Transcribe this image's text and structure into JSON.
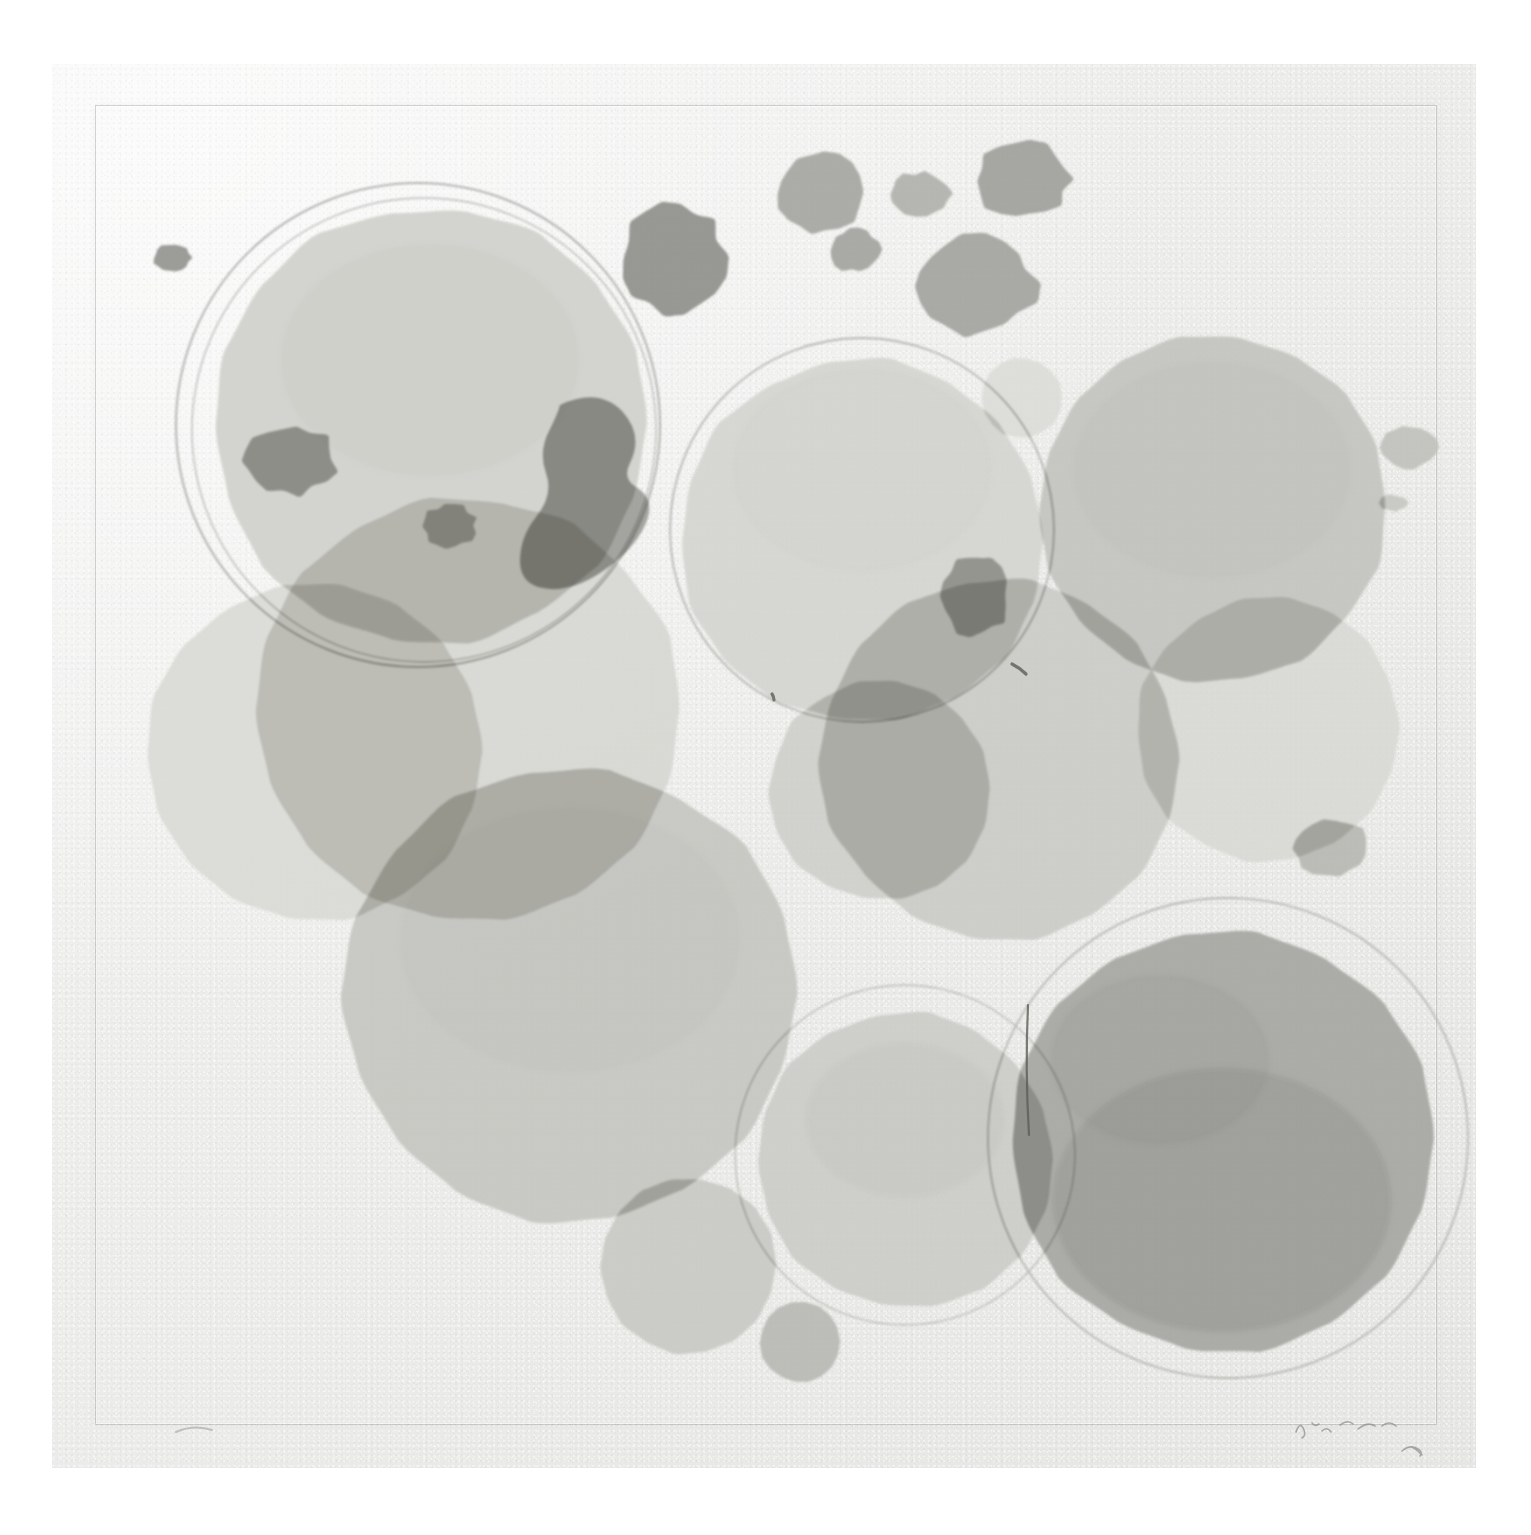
{
  "artwork": {
    "medium_appearance": "watercolor-monotype-print",
    "orientation": "square",
    "background_color": "#ffffff",
    "paper_color": "#ececea",
    "paper_edge": {
      "left": 52,
      "top": 64,
      "width": 1424,
      "height": 1404
    },
    "plate_mark": {
      "left": 95,
      "top": 105,
      "width": 1340,
      "height": 1318,
      "stroke": "#78787655"
    },
    "palette": {
      "paper": "#ececea",
      "wash_lightest": "#e4e3e0",
      "wash_light": "#dcdbd7",
      "wash_mid": "#cfcfcb",
      "wash_medium": "#c3c3bf",
      "wash_dark": "#b3b3af",
      "wash_darker": "#a4a4a0",
      "wash_darkest": "#949490",
      "ink_line": "#8d8d89",
      "pencil": "#8a8a86"
    },
    "signature": {
      "present": true,
      "position": "bottom-right",
      "type": "pencil",
      "legible": false
    },
    "edition_mark": {
      "present": true,
      "position": "bottom-left",
      "type": "pencil",
      "legible": false
    },
    "shapes": [
      {
        "name": "outline-ring-top-left",
        "kind": "ring",
        "cx": 418,
        "cy": 425,
        "r": 242,
        "stroke": "#a9a9a5",
        "stroke_width": 2.0
      },
      {
        "name": "outline-ring-top-left-inner",
        "kind": "ring",
        "cx": 424,
        "cy": 430,
        "r": 232,
        "stroke": "#b2b2ae",
        "stroke_width": 1.4
      },
      {
        "name": "outline-ring-center",
        "kind": "ring",
        "cx": 862,
        "cy": 530,
        "r": 192,
        "stroke": "#adada9",
        "stroke_width": 1.8
      },
      {
        "name": "outline-ring-bottom-right",
        "kind": "ring",
        "cx": 1228,
        "cy": 1138,
        "r": 240,
        "stroke": "#b0b0ac",
        "stroke_width": 1.8
      },
      {
        "name": "outline-ring-bottom-center",
        "kind": "ring",
        "cx": 905,
        "cy": 1155,
        "r": 170,
        "stroke": "#b4b4b0",
        "stroke_width": 1.4
      },
      {
        "name": "wash-circle-top-left-large",
        "kind": "disc",
        "cx": 430,
        "cy": 425,
        "r": 218,
        "fill": "#d1d1cd",
        "opacity": 0.95
      },
      {
        "name": "wash-circle-center-large",
        "kind": "disc",
        "cx": 862,
        "cy": 540,
        "r": 182,
        "fill": "#d4d4d0",
        "opacity": 0.92
      },
      {
        "name": "wash-circle-right-large",
        "kind": "disc",
        "cx": 1212,
        "cy": 508,
        "r": 174,
        "fill": "#c4c4c0",
        "opacity": 0.94
      },
      {
        "name": "wash-circle-left-mid",
        "kind": "disc",
        "cx": 315,
        "cy": 752,
        "r": 168,
        "fill": "#dadad6",
        "opacity": 0.95
      },
      {
        "name": "wash-circle-left-lower",
        "kind": "disc",
        "cx": 468,
        "cy": 710,
        "r": 212,
        "fill": "#d6d6d2",
        "opacity": 0.9
      },
      {
        "name": "wash-circle-bottom-left-big",
        "kind": "disc",
        "cx": 570,
        "cy": 995,
        "r": 228,
        "fill": "#c7c7c3",
        "opacity": 0.96
      },
      {
        "name": "wash-circle-mid-right",
        "kind": "disc",
        "cx": 1000,
        "cy": 760,
        "r": 180,
        "fill": "#cacac6",
        "opacity": 0.9
      },
      {
        "name": "wash-circle-mid-center",
        "kind": "disc",
        "cx": 880,
        "cy": 790,
        "r": 110,
        "fill": "#cdcdc9",
        "opacity": 0.88
      },
      {
        "name": "wash-circle-far-right-lower",
        "kind": "disc",
        "cx": 1268,
        "cy": 730,
        "r": 132,
        "fill": "#d7d7d3",
        "opacity": 0.85
      },
      {
        "name": "wash-circle-bottom-right-big",
        "kind": "disc",
        "cx": 1222,
        "cy": 1140,
        "r": 212,
        "fill": "#a8a8a4",
        "opacity": 0.95
      },
      {
        "name": "wash-circle-bottom-center",
        "kind": "disc",
        "cx": 905,
        "cy": 1160,
        "r": 148,
        "fill": "#cbcbc7",
        "opacity": 0.9
      },
      {
        "name": "wash-circle-bottom-small",
        "kind": "disc",
        "cx": 688,
        "cy": 1266,
        "r": 88,
        "fill": "#c9c9c5",
        "opacity": 0.94
      },
      {
        "name": "wash-circle-bottom-tiny",
        "kind": "disc",
        "cx": 800,
        "cy": 1342,
        "r": 40,
        "fill": "#b8b8b4",
        "opacity": 0.92
      },
      {
        "name": "wash-circle-upper-mid-small",
        "kind": "disc",
        "cx": 1022,
        "cy": 398,
        "r": 40,
        "fill": "#dcdcd8",
        "opacity": 0.9
      },
      {
        "name": "blot-top-left-dot",
        "kind": "blot",
        "cx": 172,
        "cy": 258,
        "rx": 19,
        "ry": 14,
        "fill": "#93938f"
      },
      {
        "name": "blot-top-dark-large",
        "kind": "blot",
        "cx": 673,
        "cy": 258,
        "rx": 52,
        "ry": 55,
        "fill": "#8f8f8b"
      },
      {
        "name": "blot-top-mid-1",
        "kind": "blot",
        "cx": 818,
        "cy": 193,
        "rx": 42,
        "ry": 42,
        "fill": "#a5a5a1"
      },
      {
        "name": "blot-top-mid-2",
        "kind": "blot",
        "cx": 855,
        "cy": 250,
        "rx": 25,
        "ry": 22,
        "fill": "#a3a39f"
      },
      {
        "name": "blot-top-mid-3",
        "kind": "blot",
        "cx": 920,
        "cy": 194,
        "rx": 30,
        "ry": 22,
        "fill": "#b0b0ac"
      },
      {
        "name": "blot-top-right-1",
        "kind": "blot",
        "cx": 1023,
        "cy": 180,
        "rx": 46,
        "ry": 38,
        "fill": "#9f9f9b"
      },
      {
        "name": "blot-top-right-2",
        "kind": "blot",
        "cx": 975,
        "cy": 285,
        "rx": 60,
        "ry": 48,
        "fill": "#a2a29e"
      },
      {
        "name": "blot-right-edge-1",
        "kind": "blot",
        "cx": 1408,
        "cy": 447,
        "rx": 28,
        "ry": 22,
        "fill": "#c0c0bc"
      },
      {
        "name": "blot-right-edge-2",
        "kind": "blot",
        "cx": 1393,
        "cy": 503,
        "rx": 14,
        "ry": 8,
        "fill": "#c6c6c2"
      },
      {
        "name": "blot-mid-dark-1",
        "kind": "blot",
        "cx": 975,
        "cy": 595,
        "rx": 34,
        "ry": 40,
        "fill": "#aaaaa6"
      },
      {
        "name": "blot-right-lower",
        "kind": "blot",
        "cx": 1332,
        "cy": 848,
        "rx": 38,
        "ry": 28,
        "fill": "#b7b7b3"
      },
      {
        "name": "blot-inner-dark-left",
        "kind": "blot",
        "cx": 290,
        "cy": 460,
        "rx": 46,
        "ry": 34,
        "fill": "#a4a4a0"
      },
      {
        "name": "blot-inner-small",
        "kind": "blot",
        "cx": 450,
        "cy": 526,
        "rx": 26,
        "ry": 22,
        "fill": "#b0b0ac"
      },
      {
        "name": "blot-arc-dark",
        "kind": "path",
        "fill": "#9c9c98",
        "d": "M 560 405 q 38 -18 62 6 q 22 24 8 52 q -8 16 6 24 q 20 12 10 36 q -12 28 -46 50 q -34 22 -62 14 q -18 -6 -18 -26 q 0 -24 16 -44 q 18 -22 10 -44 q -8 -22 4 -44 q 8 -16 10 -24 z"
      }
    ]
  },
  "chart_data": null
}
